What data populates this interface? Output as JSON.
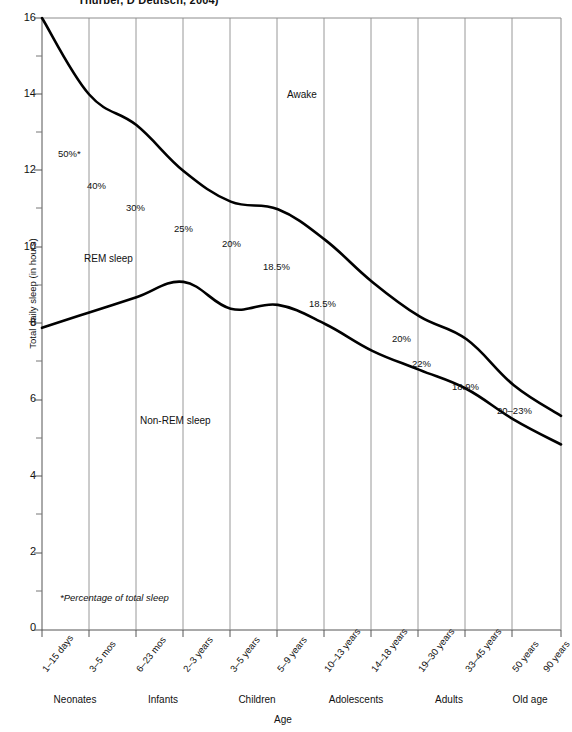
{
  "figure": {
    "clipped_title": "Thurber, D Deutsch, 2004)",
    "footnote": "*Percentage of total sleep"
  },
  "chart_data": {
    "type": "line",
    "title": "",
    "xlabel": "Age",
    "ylabel": "Total daily sleep (in hours)",
    "ylim": [
      0,
      16
    ],
    "yticks": [
      0,
      2,
      4,
      6,
      8,
      10,
      12,
      14,
      16
    ],
    "yticks_minor": [
      1,
      3,
      5,
      7,
      9,
      11,
      13,
      15
    ],
    "grid": "vertical-only",
    "legend": "inline-labels",
    "categories": [
      "1–15 days",
      "3–5 mos",
      "6–23 mos",
      "2–3 years",
      "3–5 years",
      "5–9 years",
      "10–13 years",
      "14–18 years",
      "19–30 years",
      "33–45 years",
      "50 years",
      "90 years"
    ],
    "category_groups": [
      {
        "label": "Neonates",
        "from": 0,
        "to": 1
      },
      {
        "label": "Infants",
        "from": 2,
        "to": 3
      },
      {
        "label": "Children",
        "from": 4,
        "to": 5
      },
      {
        "label": "Adolescents",
        "from": 6,
        "to": 7
      },
      {
        "label": "Adults",
        "from": 8,
        "to": 9
      },
      {
        "label": "Old age",
        "from": 10,
        "to": 11
      }
    ],
    "series": [
      {
        "name": "Total daily sleep (upper boundary: sleep vs. Awake)",
        "values": [
          16.0,
          14.0,
          13.2,
          12.0,
          11.2,
          11.0,
          10.2,
          9.1,
          8.2,
          7.6,
          6.4,
          5.6
        ]
      },
      {
        "name": "Non-REM sleep (lower boundary: Non-REM vs. REM)",
        "values": [
          7.9,
          8.3,
          8.7,
          9.1,
          8.4,
          8.5,
          8.0,
          7.3,
          6.8,
          6.3,
          5.5,
          4.85
        ]
      }
    ],
    "region_labels": [
      {
        "text": "Awake",
        "x_category_index": 6,
        "y_hours": 14.0
      },
      {
        "text": "REM sleep",
        "x_category_index": 1,
        "y_hours": 9.8
      },
      {
        "text": "Non-REM sleep",
        "x_category_index": 3,
        "y_hours": 5.0
      }
    ],
    "annotations": [
      {
        "text": "50%*",
        "x_category_index": 0,
        "y_hours": 11.9
      },
      {
        "text": "40%",
        "x_category_index": 1,
        "y_hours": 11.3
      },
      {
        "text": "30%",
        "x_category_index": 2,
        "y_hours": 10.7
      },
      {
        "text": "25%",
        "x_category_index": 3,
        "y_hours": 10.2
      },
      {
        "text": "20%",
        "x_category_index": 4,
        "y_hours": 9.8
      },
      {
        "text": "18.5%",
        "x_category_index": 5,
        "y_hours": 9.3
      },
      {
        "text": "18.5%",
        "x_category_index": 6,
        "y_hours": 8.4
      },
      {
        "text": "20%",
        "x_category_index": 7,
        "y_hours": 7.6
      },
      {
        "text": "22%",
        "x_category_index": 8,
        "y_hours": 7.0
      },
      {
        "text": "18.9%",
        "x_category_index": 9,
        "y_hours": 6.4
      },
      {
        "text": "20–23%",
        "x_category_index": 10,
        "y_hours": 5.8
      }
    ],
    "colors": {
      "curve": "#000000",
      "gridline": "#8c8c8c",
      "axis": "#555555",
      "background": "#ffffff"
    }
  },
  "ytick_labels": [
    "16",
    "14",
    "12",
    "10",
    "8",
    "6",
    "4",
    "2",
    "0"
  ]
}
